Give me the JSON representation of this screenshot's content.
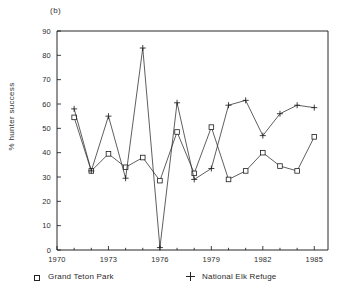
{
  "panel": {
    "label": "(b)"
  },
  "axes": {
    "ylabel": "% hunter success",
    "xlabel": "",
    "y_ticks": [
      "0",
      "10",
      "20",
      "30",
      "40",
      "50",
      "60",
      "70",
      "80",
      "90"
    ],
    "x_ticks": [
      "1970",
      "1973",
      "1976",
      "1979",
      "1982",
      "1985"
    ]
  },
  "legend": {
    "items": [
      {
        "marker": "square-marker",
        "label": "Grand Teton Park"
      },
      {
        "marker": "plus-marker",
        "label": "National Elk Refuge"
      }
    ]
  },
  "chart_data": {
    "type": "line",
    "title": "(b)",
    "xlabel": "",
    "ylabel": "% hunter success",
    "xlim": [
      1970,
      1985.8
    ],
    "ylim": [
      0,
      90
    ],
    "yticks": [
      0,
      10,
      20,
      30,
      40,
      50,
      60,
      70,
      80,
      90
    ],
    "xticks": [
      1970,
      1973,
      1976,
      1979,
      1982,
      1985
    ],
    "xminorticks": [
      1971,
      1972,
      1974,
      1975,
      1977,
      1978,
      1980,
      1981,
      1983,
      1984
    ],
    "grid": false,
    "legend_position": "below-axes",
    "x": [
      1971,
      1972,
      1973,
      1974,
      1975,
      1976,
      1977,
      1978,
      1979,
      1980,
      1981,
      1982,
      1983,
      1984,
      1985
    ],
    "series": [
      {
        "name": "Grand Teton Park",
        "marker": "square",
        "values": [
          54.5,
          32.5,
          39.5,
          34.0,
          38.0,
          28.5,
          48.5,
          31.5,
          50.5,
          29.0,
          32.5,
          40.0,
          34.5,
          32.5,
          46.5
        ]
      },
      {
        "name": "National Elk Refuge",
        "marker": "plus",
        "values": [
          58.0,
          32.5,
          55.0,
          29.5,
          83.0,
          1.0,
          60.5,
          29.0,
          33.5,
          59.5,
          61.5,
          47.0,
          56.0,
          59.5,
          58.5
        ]
      }
    ]
  }
}
